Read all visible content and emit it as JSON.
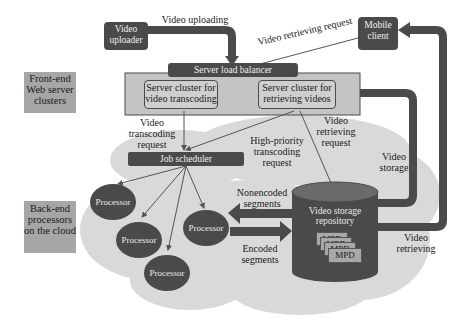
{
  "diagram": {
    "side_labels": {
      "frontend": "Front-end Web server clusters",
      "backend": "Back-end processors on the cloud"
    },
    "nodes": {
      "video_uploader": "Video uploader",
      "mobile_client": "Mobile client",
      "load_balancer": "Server load balancer",
      "cluster_transcoding": "Server cluster for video transcoding",
      "cluster_retrieving": "Server cluster for retrieving videos",
      "job_scheduler": "Job scheduler",
      "processors": [
        "Processor",
        "Processor",
        "Processor",
        "Processor"
      ],
      "storage": "Video storage repository",
      "mpd_items": [
        "MPD",
        "MPD",
        "MPD",
        "MPD"
      ]
    },
    "edge_labels": {
      "video_uploading": "Video uploading",
      "video_retrieving_request_top": "Video retrieving request",
      "video_transcoding_request": "Video transcoding request",
      "high_priority": "High-priority transcoding request",
      "video_retrieving_request": "Video retrieving request",
      "video_storage": "Video storage",
      "nonencoded_segments": "Nonencoded segments",
      "encoded_segments": "Encoded segments",
      "video_retrieving": "Video retrieving"
    },
    "colors": {
      "dark_box": "#4a4a4a",
      "cloud": "#d9d9d9",
      "side_box": "#a6a6a6",
      "cluster_panel": "#c4c4c4"
    }
  }
}
